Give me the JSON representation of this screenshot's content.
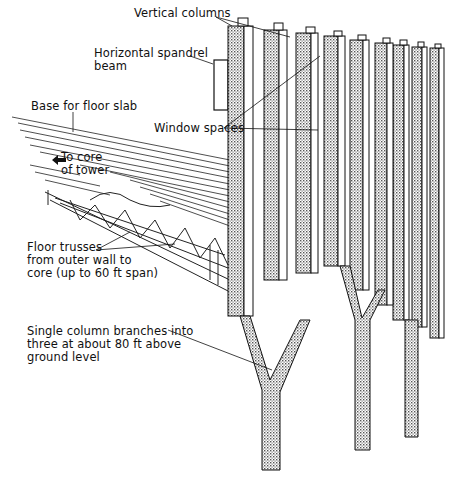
{
  "diagram": {
    "colors": {
      "ink": "#111111",
      "background": "#ffffff",
      "stipple": "#8a8a8a"
    },
    "labels": {
      "vertical_columns": "Vertical columns",
      "spandrel_line1": "Horizontal spandrel",
      "spandrel_line2": "beam",
      "floor_slab": "Base for floor slab",
      "core_line1": "To core",
      "core_line2": "of tower",
      "window_spaces": "Window spaces",
      "trusses_line1": "Floor trusses",
      "trusses_line2": "from outer wall to",
      "trusses_line3": "core (up to 60 ft span)",
      "branch_line1": "Single column branches into",
      "branch_line2": "three at about 80 ft above",
      "branch_line3": "ground level"
    }
  }
}
